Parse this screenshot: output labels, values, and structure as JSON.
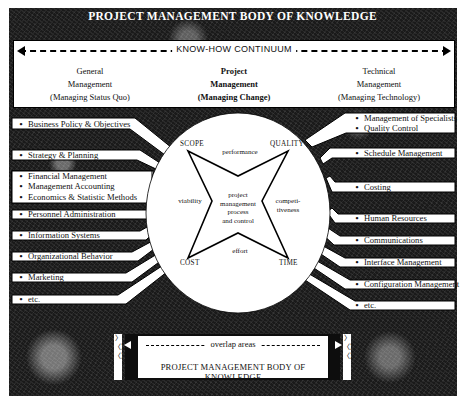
{
  "title": "PROJECT MANAGEMENT BODY OF KNOWLEDGE",
  "continuum": {
    "label": "KNOW-HOW CONTINUUM",
    "columns": [
      {
        "line1": "General",
        "line2": "Management",
        "line3": "(Managing Status Quo)"
      },
      {
        "line1": "Project",
        "line2": "Management",
        "line3": "(Managing Change)"
      },
      {
        "line1": "Technical",
        "line2": "Management",
        "line3": "(Managing Technology)"
      }
    ]
  },
  "left_items": [
    "Business Policy & Objectives",
    "Strategy & Planning",
    "Financial Management",
    "Management Accounting",
    "Economics & Statistic Methods",
    "Personnel Administration",
    "Information Systems",
    "Organizational Behavior",
    "Marketing",
    "etc."
  ],
  "right_items": [
    "Management of Specialists",
    "Quality Control",
    "Schedule Management",
    "Costing",
    "Human Resources",
    "Communications",
    "Interface Management",
    "Configuration Management",
    "etc."
  ],
  "bullet": "•",
  "circle": {
    "corners": {
      "top_left": "SCOPE",
      "top_right": "QUALITY",
      "bottom_left": "COST",
      "bottom_right": "TIME"
    },
    "edges": {
      "top": "performance",
      "left": "viability",
      "right_1": "competi-",
      "right_2": "tiveness",
      "bottom": "effort"
    },
    "center": [
      "project",
      "management",
      "process",
      "and control"
    ]
  },
  "bottom": {
    "overlap_label": "overlap areas",
    "title": "PROJECT MANAGEMENT BODY OF KNOWLEDGE",
    "squiggle": "〉〈〉〈〉"
  }
}
